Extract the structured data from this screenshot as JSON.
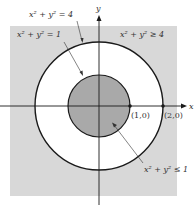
{
  "diagram": {
    "type": "region-diagram",
    "axes": {
      "x_label": "x",
      "y_label": "y"
    },
    "curves": [
      {
        "equation": "x² + y² = 4",
        "radius": 2
      },
      {
        "equation": "x² + y² = 1",
        "radius": 1
      }
    ],
    "regions": [
      {
        "label": "x² + y² ≥ 4",
        "fill": "#d8d8d8"
      },
      {
        "label": "x² + y² ≤ 1",
        "fill": "#a9a9a9"
      }
    ],
    "points": [
      {
        "label": "(1,0)"
      },
      {
        "label": "(2,0)"
      }
    ],
    "labels": {
      "outer_circle": "x² + y² = 4",
      "inner_circle": "x² + y² = 1",
      "outer_region": "x² + y² ≥ 4",
      "inner_region": "x² + y² ≤ 1",
      "point_1": "(1,0)",
      "point_2": "(2,0)",
      "x_axis": "x",
      "y_axis": "y"
    },
    "colors": {
      "outer_region_fill": "#d8d8d8",
      "inner_disc_fill": "#a9a9a9",
      "annulus_fill": "#ffffff",
      "stroke": "#1a1a1a"
    }
  }
}
